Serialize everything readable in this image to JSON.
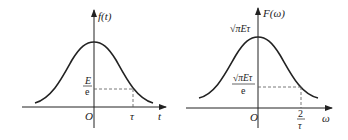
{
  "left_plot": {
    "function_label": "f(t)",
    "origin_label": "O",
    "x_axis_label": "t",
    "tick_label": "τ",
    "level_numerator": "E",
    "level_denominator": "e"
  },
  "right_plot": {
    "function_label": "F(ω)",
    "origin_label": "O",
    "x_axis_label": "ω",
    "peak_label": "√πEτ",
    "level_numerator": "√πEτ",
    "level_denominator": "e",
    "tick_numerator": "2",
    "tick_denominator": "τ"
  },
  "colors": {
    "ink": "#222222",
    "dashed": "#555555"
  }
}
